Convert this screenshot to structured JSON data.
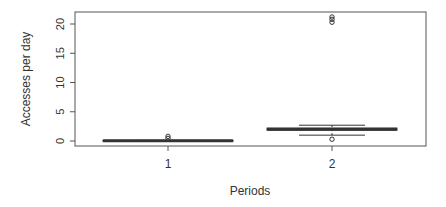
{
  "chart_data": {
    "type": "box",
    "title": "",
    "xlabel": "Periods",
    "ylabel": "Accesses per day",
    "categories": [
      "1",
      "2"
    ],
    "ylim": [
      -0.8,
      22.1
    ],
    "yticks": [
      0,
      5,
      10,
      15,
      20
    ],
    "grid": false,
    "legend": null,
    "series": [
      {
        "name": "1",
        "whisker_low": 0.0,
        "q1": 0.0,
        "median": 0.05,
        "q3": 0.1,
        "whisker_high": 0.1,
        "outliers": [
          0.45,
          0.8
        ]
      },
      {
        "name": "2",
        "whisker_low": 1.0,
        "q1": 1.85,
        "median": 2.0,
        "q3": 2.2,
        "whisker_high": 2.7,
        "outliers": [
          0.3,
          20.3,
          20.8,
          21.2
        ]
      }
    ]
  },
  "colors": {
    "box_line": "#333333",
    "axis": "#555555",
    "text": "#333333",
    "background": "#ffffff"
  }
}
